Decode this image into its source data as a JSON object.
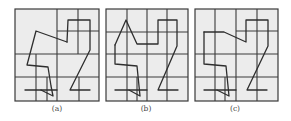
{
  "figure": {
    "background": "#ffffff",
    "panel_fill": "#ececec",
    "line_color": "#3a3a3a",
    "panels": [
      {
        "id": "a",
        "label": "(a)",
        "label_pos": [
          57,
          111
        ],
        "frame": [
          15,
          9,
          84,
          92
        ],
        "grid": [
          [
            57,
            9,
            57,
            101
          ],
          [
            78,
            9,
            78,
            54
          ],
          [
            57,
            31,
            99,
            31
          ],
          [
            15,
            54,
            99,
            54
          ],
          [
            15,
            77,
            99,
            77
          ],
          [
            36,
            54,
            36,
            101
          ],
          [
            47,
            77,
            47,
            101
          ],
          [
            79,
            77,
            79,
            101
          ]
        ],
        "paths": [
          [
            [
              67,
              42
            ],
            [
              36,
              31
            ],
            [
              27,
              65
            ],
            [
              48,
              67
            ],
            [
              51,
              86
            ],
            [
              53,
              96
            ],
            [
              41,
              90
            ]
          ],
          [
            [
              25,
              90
            ],
            [
              57,
              90
            ]
          ],
          [
            [
              67,
              42
            ],
            [
              68,
              20
            ],
            [
              90,
              20
            ],
            [
              90,
              50
            ],
            [
              70,
              90
            ],
            [
              90,
              90
            ]
          ]
        ]
      },
      {
        "id": "b",
        "label": "(b)",
        "label_pos": [
          146,
          111
        ],
        "frame": [
          106,
          9,
          82,
          92
        ],
        "grid": [
          [
            127,
            9,
            127,
            101
          ],
          [
            147,
            9,
            147,
            101
          ],
          [
            167,
            9,
            167,
            101
          ],
          [
            106,
            32,
            188,
            32
          ],
          [
            106,
            54,
            188,
            54
          ],
          [
            106,
            77,
            188,
            77
          ],
          [
            137,
            77,
            137,
            101
          ]
        ],
        "paths": [
          [
            [
              115,
              45
            ],
            [
              126,
              20
            ],
            [
              137,
              44
            ],
            [
              158,
              44
            ],
            [
              158,
              20
            ],
            [
              177,
              20
            ],
            [
              177,
              46
            ],
            [
              158,
              90
            ],
            [
              178,
              90
            ]
          ],
          [
            [
              115,
              45
            ],
            [
              115,
              64
            ],
            [
              137,
              66
            ],
            [
              139,
              86
            ],
            [
              140,
              96
            ],
            [
              129,
              90
            ]
          ],
          [
            [
              115,
              90
            ],
            [
              147,
              90
            ]
          ]
        ]
      },
      {
        "id": "c",
        "label": "(c)",
        "label_pos": [
          235,
          111
        ],
        "frame": [
          195,
          9,
          83,
          92
        ],
        "grid": [
          [
            215,
            9,
            215,
            101
          ],
          [
            236,
            9,
            236,
            101
          ],
          [
            257,
            9,
            257,
            101
          ],
          [
            236,
            31,
            278,
            31
          ],
          [
            195,
            54,
            278,
            54
          ],
          [
            195,
            77,
            278,
            77
          ],
          [
            225,
            77,
            225,
            101
          ]
        ],
        "paths": [
          [
            [
              204,
              32
            ],
            [
              224,
              32
            ],
            [
              246,
              42
            ],
            [
              246,
              20
            ],
            [
              268,
              20
            ],
            [
              268,
              46
            ],
            [
              247,
              90
            ],
            [
              267,
              90
            ]
          ],
          [
            [
              204,
              32
            ],
            [
              204,
              64
            ],
            [
              226,
              66
            ],
            [
              228,
              86
            ],
            [
              229,
              96
            ],
            [
              217,
              90
            ]
          ],
          [
            [
              204,
              90
            ],
            [
              236,
              90
            ]
          ]
        ]
      }
    ]
  }
}
